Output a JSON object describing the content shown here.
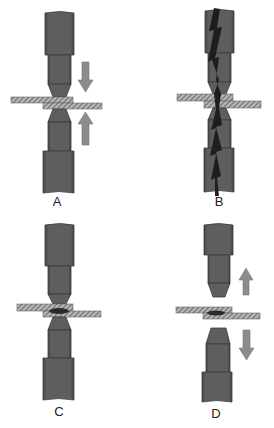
{
  "diagram": {
    "colors": {
      "electrode": "#5c5c5c",
      "electrode_edge": "#3c3c3c",
      "arrow": "#8c8c8c",
      "plate": "#b4b4b4",
      "plate_hatch": "#7a7a7a",
      "nugget": "#2a2a2a",
      "spark": "#1e1e1e"
    },
    "panels": [
      {
        "id": "A",
        "label": "A",
        "step": "electrodes squeeze sheets (force applied)"
      },
      {
        "id": "B",
        "label": "B",
        "step": "current flows through electrodes"
      },
      {
        "id": "C",
        "label": "C",
        "step": "weld nugget formed"
      },
      {
        "id": "D",
        "label": "D",
        "step": "electrodes retract"
      }
    ]
  }
}
